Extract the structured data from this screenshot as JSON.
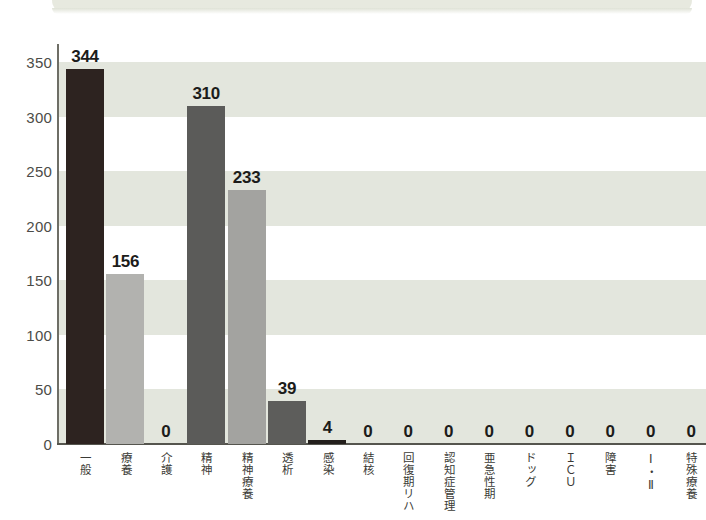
{
  "decor": {
    "top_band_name": "scanned-page-band"
  },
  "chart_data": {
    "type": "bar",
    "title": "",
    "xlabel": "",
    "ylabel": "",
    "ylim": [
      0,
      350
    ],
    "ytick_step": 50,
    "yticks": [
      "350",
      "300",
      "250",
      "200",
      "150",
      "100",
      "50",
      "0"
    ],
    "grid": "horizontal-alternating-bands",
    "legend": "none",
    "categories": [
      "一般",
      "療養",
      "介護",
      "精神",
      "精神療養",
      "透析",
      "感染",
      "結核",
      "回復期リハ",
      "認知症管理",
      "亜急性期",
      "ドッグ",
      "ＩＣＵ",
      "障害",
      "Ⅰ・Ⅱ",
      "特殊療養"
    ],
    "values": [
      344,
      156,
      0,
      310,
      233,
      39,
      4,
      0,
      0,
      0,
      0,
      0,
      0,
      0,
      0,
      0
    ],
    "value_labels": [
      "344",
      "156",
      "0",
      "310",
      "233",
      "39",
      "4",
      "0",
      "0",
      "0",
      "0",
      "0",
      "0",
      "0",
      "0",
      "0"
    ],
    "bar_colors": [
      "#2d2320",
      "#b2b2af",
      "#b2b2af",
      "#5b5b59",
      "#a3a3a0",
      "#5d5d5b",
      "#231f1c",
      "#5d5d5b",
      "#5d5d5b",
      "#5d5d5b",
      "#5d5d5b",
      "#5d5d5b",
      "#5d5d5b",
      "#5d5d5b",
      "#5d5d5b",
      "#5d5d5b"
    ],
    "colors": {
      "band": "#e3e6dd",
      "plot_background": "#ffffff",
      "axis": "#55554e",
      "tick_text": "#4c4c48",
      "value_text": "#1c1c1a",
      "category_text": "#3b3b36"
    }
  }
}
